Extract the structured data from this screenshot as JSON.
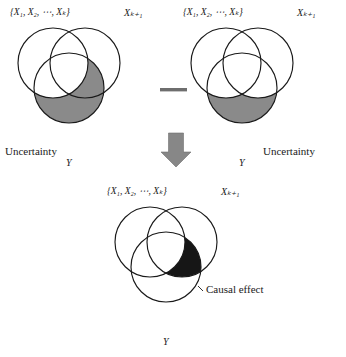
{
  "figure": {
    "caption_present": false,
    "background_color": "#ffffff",
    "outline_color": "#1a1a1a",
    "gray_fill_color": "#8a8a8a",
    "black_fill_color": "#161616",
    "arrow_color": "#878787",
    "minus_color": "#6e6e6e"
  },
  "operator": {
    "minus_symbol": "—",
    "arrow_symbol": "↓"
  },
  "diagrams": [
    {
      "id": "minuend",
      "position": "top-left",
      "circles": [
        {
          "name": "set-x-1-to-k",
          "label_text": "{X1, X2, ⋯, Xk}",
          "cx": 53,
          "cy": 63,
          "r": 35
        },
        {
          "name": "set-x-k-plus-1",
          "label_text": "Xk+1",
          "cx": 85,
          "cy": 63,
          "r": 35
        },
        {
          "name": "set-y",
          "label_text": "Y",
          "cx": 69,
          "cy": 88,
          "r": 35
        }
      ],
      "labels": {
        "left_set": "{X₁, X₂, ⋯, Xₖ}",
        "right_set": "Xₖ₊₁",
        "bottom_set": "Y",
        "region_label": "Uncertainty"
      },
      "shaded_region": {
        "fill": "#8a8a8a",
        "description": "Y minus the first-k X set"
      }
    },
    {
      "id": "subtrahend",
      "position": "top-right",
      "circles": [
        {
          "name": "set-x-1-to-k",
          "label_text": "{X1, X2, ⋯, Xk}",
          "cx": 226,
          "cy": 63,
          "r": 35
        },
        {
          "name": "set-x-k-plus-1",
          "label_text": "Xk+1",
          "cx": 258,
          "cy": 63,
          "r": 35
        },
        {
          "name": "set-y",
          "label_text": "Y",
          "cx": 242,
          "cy": 88,
          "r": 35
        }
      ],
      "labels": {
        "left_set": "{X₁, X₂, ⋯, Xₖ}",
        "right_set": "Xₖ₊₁",
        "bottom_set": "Y",
        "region_label": "Uncertainty"
      },
      "shaded_region": {
        "fill": "#8a8a8a",
        "description": "Y minus both X sets"
      }
    },
    {
      "id": "result",
      "position": "bottom-center",
      "circles": [
        {
          "name": "set-x-1-to-k",
          "label_text": "{X1, X2, ⋯, Xk}",
          "cx": 150,
          "cy": 242,
          "r": 35
        },
        {
          "name": "set-x-k-plus-1",
          "label_text": "Xk+1",
          "cx": 182,
          "cy": 242,
          "r": 35
        },
        {
          "name": "set-y",
          "label_text": "Y",
          "cx": 166,
          "cy": 267,
          "r": 35
        }
      ],
      "labels": {
        "left_set": "{X₁, X₂, ⋯, Xₖ}",
        "right_set": "Xₖ₊₁",
        "bottom_set": "Y",
        "region_label": "Causal effect"
      },
      "shaded_region": {
        "fill": "#161616",
        "description": "Intersection of X k+1 and Y, excluding the first-k X set"
      }
    }
  ],
  "text_labels": {
    "d1_left_set": "{X₁, X₂, ⋯, Xₖ}",
    "d1_right_set": "Xₖ₊₁",
    "d1_y": "Y",
    "d1_uncertainty": "Uncertainty",
    "d2_left_set": "{X₁, X₂, ⋯, Xₖ}",
    "d2_right_set": "Xₖ₊₁",
    "d2_y": "Y",
    "d2_uncertainty": "Uncertainty",
    "d3_left_set": "{X₁, X₂, ⋯, Xₖ}",
    "d3_right_set": "Xₖ₊₁",
    "d3_y": "Y",
    "d3_causal_effect": "Causal effect"
  }
}
